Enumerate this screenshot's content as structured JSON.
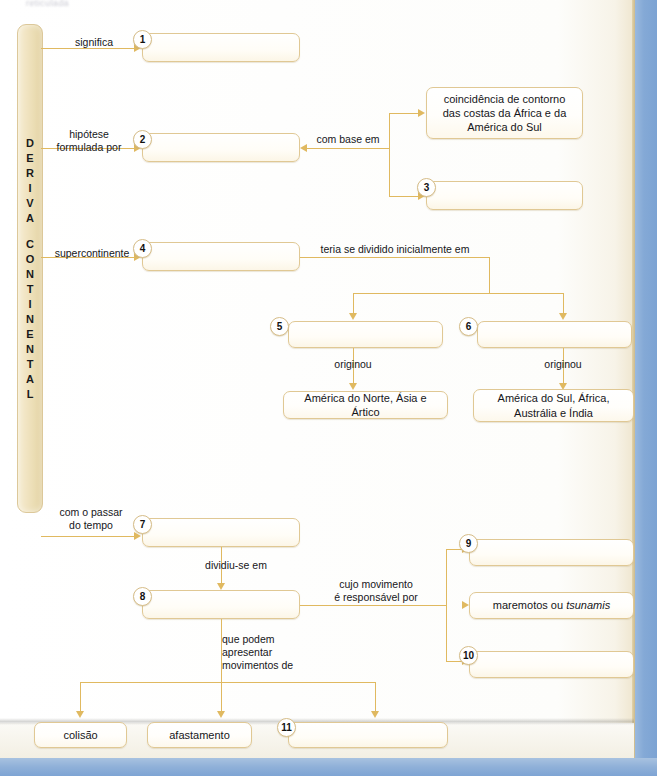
{
  "page": {
    "top_fragment": "reticulada",
    "spine_label": "DERIVA CONTINENTAL",
    "spine_letters": [
      "D",
      "E",
      "R",
      "I",
      "V",
      "A",
      "",
      "C",
      "O",
      "N",
      "T",
      "I",
      "N",
      "E",
      "N",
      "T",
      "A",
      "L"
    ],
    "accent_color": "#e0b960",
    "box_border_color": "#e0c894",
    "spine_color": "#eadcb2",
    "blue_background": "#84a9d6"
  },
  "labels": {
    "significa": "significa",
    "hipotese": "hipótese\nformulada por",
    "com_base_em": "com base em",
    "supercontinente": "supercontinente",
    "teria_se_dividido": "teria se dividido inicialmente em",
    "originou_left": "originou",
    "originou_right": "originou",
    "com_o_passar": "com o passar\ndo tempo",
    "dividiu_se_em": "dividiu-se em",
    "cujo_movimento": "cujo movimento\né responsável por",
    "que_podem": "que podem\napresentar\nmovimentos de"
  },
  "boxes": [
    {
      "id": "box-1",
      "number": "1",
      "text": ""
    },
    {
      "id": "box-2",
      "number": "2",
      "text": ""
    },
    {
      "id": "box-coincidencia",
      "number": "",
      "text": "coincidência de contorno das costas da África e da América do Sul"
    },
    {
      "id": "box-3",
      "number": "3",
      "text": ""
    },
    {
      "id": "box-4",
      "number": "4",
      "text": ""
    },
    {
      "id": "box-5",
      "number": "5",
      "text": ""
    },
    {
      "id": "box-6",
      "number": "6",
      "text": ""
    },
    {
      "id": "box-america-norte",
      "number": "",
      "text": "América do Norte, Ásia e Ártico"
    },
    {
      "id": "box-america-sul",
      "number": "",
      "text": "América do Sul, África, Austrália e Índia"
    },
    {
      "id": "box-7",
      "number": "7",
      "text": ""
    },
    {
      "id": "box-8",
      "number": "8",
      "text": ""
    },
    {
      "id": "box-9",
      "number": "9",
      "text": ""
    },
    {
      "id": "box-maremotos",
      "number": "",
      "text": "maremotos ou tsunamis"
    },
    {
      "id": "box-10",
      "number": "10",
      "text": ""
    },
    {
      "id": "box-colisao",
      "number": "",
      "text": "colisão"
    },
    {
      "id": "box-afastamento",
      "number": "",
      "text": "afastamento"
    },
    {
      "id": "box-11",
      "number": "11",
      "text": ""
    }
  ],
  "box_text": {
    "b1": "",
    "b2": "",
    "coincidencia_l1": "coincidência de contorno",
    "coincidencia_l2": "das costas da África e da",
    "coincidencia_l3": "América do Sul",
    "b3": "",
    "b4": "",
    "b5": "",
    "b6": "",
    "america_norte": "América do Norte, Ásia e Ártico",
    "america_sul_l1": "América do Sul, África,",
    "america_sul_l2": "Austrália e Índia",
    "b7": "",
    "b8": "",
    "b9": "",
    "maremotos_pre": "maremotos ou ",
    "maremotos_em": "tsunamis",
    "b10": "",
    "colisao": "colisão",
    "afastamento": "afastamento",
    "b11": ""
  },
  "numbers": {
    "n1": "1",
    "n2": "2",
    "n3": "3",
    "n4": "4",
    "n5": "5",
    "n6": "6",
    "n7": "7",
    "n8": "8",
    "n9": "9",
    "n10": "10",
    "n11": "11"
  }
}
